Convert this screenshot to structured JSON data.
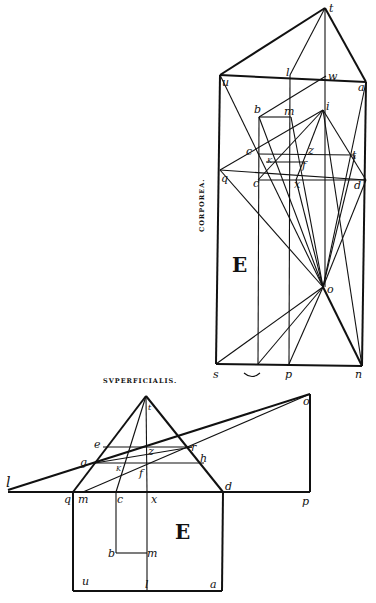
{
  "upper_figure": {
    "caption": "CORPOREA.",
    "region_label": "E",
    "labels": {
      "t": "t",
      "u": "u",
      "a": "a",
      "l": "l",
      "w": "w",
      "b": "b",
      "m": "m",
      "i": "i",
      "c_upper": "c",
      "k": "K",
      "z": "z",
      "f": "f",
      "t_right": "t",
      "q": "q",
      "c_lower": "c",
      "x": "x",
      "d": "d",
      "o": "o",
      "s": "s",
      "p": "p",
      "n": "n"
    }
  },
  "lower_figure": {
    "caption": "SVPERFICIALIS.",
    "region_label": "E",
    "labels": {
      "t": "t",
      "o": "o",
      "e": "e",
      "z": "z",
      "r": "r",
      "g": "g",
      "k": "K",
      "f": "f",
      "h": "h",
      "l": "l",
      "q": "q",
      "m": "m",
      "c": "c",
      "x": "x",
      "d": "d",
      "p": "p",
      "b": "b",
      "m_inner": "m",
      "u": "u",
      "l_bottom": "l",
      "a": "a"
    }
  }
}
